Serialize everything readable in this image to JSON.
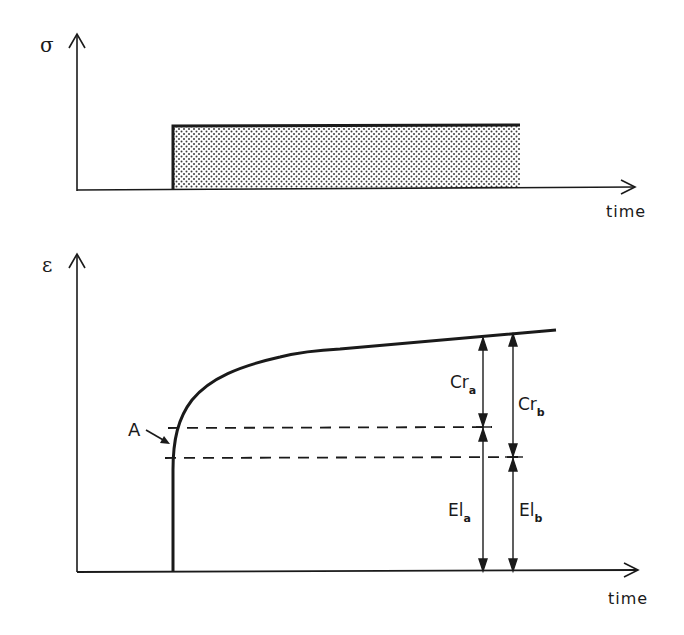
{
  "figure": {
    "top_panel": {
      "y_axis_label": "σ",
      "x_axis_label": "time",
      "description": "Constant stress step applied and held (shaded region)"
    },
    "bottom_panel": {
      "y_axis_label": "ε",
      "x_axis_label": "time",
      "point_label": "A",
      "annotations": {
        "creep_a": {
          "main": "Cr",
          "sub": "a"
        },
        "creep_b": {
          "main": "Cr",
          "sub": "b"
        },
        "elastic_a": {
          "main": "El",
          "sub": "a"
        },
        "elastic_b": {
          "main": "El",
          "sub": "b"
        }
      }
    },
    "colors": {
      "ink": "#1a1a1a",
      "background": "#ffffff"
    }
  }
}
